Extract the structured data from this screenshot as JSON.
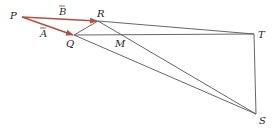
{
  "diagram": {
    "points": {
      "P": {
        "label": "P",
        "x": 22,
        "y": 17
      },
      "R": {
        "label": "R",
        "x": 98,
        "y": 21
      },
      "Q": {
        "label": "Q",
        "x": 74,
        "y": 35
      },
      "T": {
        "label": "T",
        "x": 254,
        "y": 34
      },
      "S": {
        "label": "S",
        "x": 256,
        "y": 114
      },
      "M": {
        "label": "M",
        "x": 126,
        "y": 34
      }
    },
    "vectors": [
      {
        "from": "P",
        "to": "R",
        "label": "B",
        "color": "#b5503f"
      },
      {
        "from": "P",
        "to": "Q",
        "label": "A",
        "color": "#b5503f"
      }
    ],
    "segments": [
      [
        "Q",
        "R"
      ],
      [
        "R",
        "T"
      ],
      [
        "Q",
        "T"
      ],
      [
        "R",
        "S"
      ],
      [
        "Q",
        "S"
      ],
      [
        "T",
        "S"
      ]
    ],
    "line_color": "#555555"
  }
}
